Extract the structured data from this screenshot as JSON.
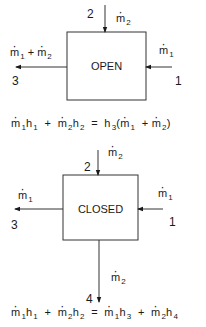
{
  "open_diagram": {
    "box_label": "OPEN",
    "inlet_top": {
      "port": "2",
      "flow": "m",
      "flow_sub": "2"
    },
    "outlet_left": {
      "port": "3",
      "flow_a": "m",
      "flow_a_sub": "1",
      "plus": "+",
      "flow_b": "m",
      "flow_b_sub": "2"
    },
    "inlet_right": {
      "port": "1",
      "flow": "m",
      "flow_sub": "1"
    }
  },
  "equation_open": {
    "t1": "m",
    "t1s": "1",
    "t1h": "h",
    "t1hs": "1",
    "plus1": "+",
    "t2": "m",
    "t2s": "2",
    "t2h": "h",
    "t2hs": "2",
    "eq": "=",
    "rh": "h",
    "rhs": "3",
    "lp": "(",
    "r1": "m",
    "r1s": "1",
    "plus2": "+",
    "r2": "m",
    "r2s": "2",
    "rp": ")"
  },
  "closed_diagram": {
    "box_label": "CLOSED",
    "inlet_top": {
      "port": "2",
      "flow": "m",
      "flow_sub": "2"
    },
    "outlet_left": {
      "port": "3",
      "flow": "m",
      "flow_sub": "1"
    },
    "inlet_right": {
      "port": "1",
      "flow": "m",
      "flow_sub": "1"
    },
    "outlet_bottom": {
      "port": "4",
      "flow": "m",
      "flow_sub": "2"
    }
  },
  "equation_closed": {
    "t1": "m",
    "t1s": "1",
    "t1h": "h",
    "t1hs": "1",
    "plus1": "+",
    "t2": "m",
    "t2s": "2",
    "t2h": "h",
    "t2hs": "2",
    "eq": "=",
    "r1": "m",
    "r1s": "1",
    "r1h": "h",
    "r1hs": "3",
    "plus2": "+",
    "r2": "m",
    "r2s": "2",
    "r2h": "h",
    "r2hs": "4"
  }
}
